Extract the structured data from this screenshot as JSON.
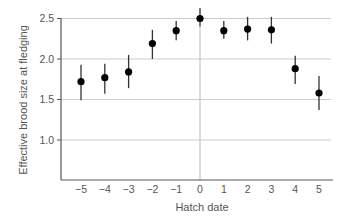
{
  "chart_data": {
    "type": "scatter",
    "title": "",
    "xlabel": "Hatch date",
    "ylabel": "Effective brood size at fledging",
    "xlim": [
      -5.8,
      5.6
    ],
    "ylim": [
      0.5,
      2.5
    ],
    "x_ticks": [
      -5,
      -4,
      -3,
      -2,
      -1,
      0,
      1,
      2,
      3,
      4,
      5
    ],
    "x_tick_labels": [
      "−5",
      "−4",
      "−3",
      "−2",
      "−1",
      "0",
      "1",
      "2",
      "3",
      "4",
      "5"
    ],
    "y_ticks": [
      1.0,
      1.5,
      2.0,
      2.5
    ],
    "y_tick_labels": [
      "1.0",
      "1.5",
      "2.0",
      "2.5"
    ],
    "grid": "horizontal",
    "reference_line_x": 0,
    "legend": null,
    "series": [
      {
        "name": "Effective brood size",
        "x": [
          -5,
          -4,
          -3,
          -2,
          -1,
          0,
          1,
          2,
          3,
          4,
          5
        ],
        "y": [
          1.72,
          1.77,
          1.84,
          2.19,
          2.35,
          2.5,
          2.35,
          2.37,
          2.36,
          1.88,
          1.58
        ],
        "y_lower": [
          1.49,
          1.57,
          1.64,
          2.0,
          2.23,
          2.4,
          2.25,
          2.23,
          2.19,
          1.69,
          1.37
        ],
        "y_upper": [
          1.93,
          1.94,
          2.05,
          2.36,
          2.47,
          2.63,
          2.47,
          2.52,
          2.52,
          2.04,
          1.79
        ]
      }
    ]
  },
  "colors": {
    "point": "#000000",
    "errorbar": "#333333",
    "gridline": "#cccccc",
    "axis": "#555555",
    "reference_line": "#bbbbbb",
    "text": "#555555"
  }
}
